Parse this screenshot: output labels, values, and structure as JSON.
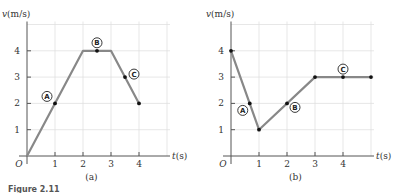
{
  "chart_data": [
    {
      "type": "line",
      "panel_label": "(a)",
      "xlabel": "t (s)",
      "ylabel": "v(m/s)",
      "origin_label": "O",
      "xlim": [
        0,
        5
      ],
      "ylim": [
        0,
        5
      ],
      "xticks": [
        1,
        2,
        3,
        4
      ],
      "yticks": [
        1,
        2,
        3,
        4
      ],
      "grid": true,
      "x": [
        0,
        2,
        3,
        4
      ],
      "y": [
        0,
        4,
        4,
        2
      ],
      "points": [
        {
          "label": "A",
          "t": 1,
          "v": 2,
          "label_side": "upper-left"
        },
        {
          "label": "B",
          "t": 2.5,
          "v": 4,
          "label_side": "above"
        },
        {
          "label": "C",
          "t": 3.5,
          "v": 3,
          "label_side": "right"
        },
        {
          "label": "",
          "t": 4,
          "v": 2,
          "label_side": "none"
        }
      ]
    },
    {
      "type": "line",
      "panel_label": "(b)",
      "xlabel": "t (s)",
      "ylabel": "v(m/s)",
      "origin_label": "O",
      "xlim": [
        0,
        5
      ],
      "ylim": [
        0,
        5
      ],
      "xticks": [
        1,
        2,
        3,
        4
      ],
      "yticks": [
        1,
        2,
        3,
        4
      ],
      "grid": true,
      "x": [
        0,
        1,
        3,
        5
      ],
      "y": [
        4,
        1,
        3,
        3
      ],
      "points": [
        {
          "label": "",
          "t": 0,
          "v": 4,
          "label_side": "none"
        },
        {
          "label": "A",
          "t": 0.67,
          "v": 2,
          "label_side": "lower-left"
        },
        {
          "label": "",
          "t": 1,
          "v": 1,
          "label_side": "none"
        },
        {
          "label": "B",
          "t": 2,
          "v": 2,
          "label_side": "lower-right"
        },
        {
          "label": "",
          "t": 3,
          "v": 3,
          "label_side": "none"
        },
        {
          "label": "C",
          "t": 4,
          "v": 3,
          "label_side": "above"
        },
        {
          "label": "",
          "t": 5,
          "v": 3,
          "label_side": "none"
        }
      ]
    }
  ],
  "caption_fragment": "Figure 2.11"
}
